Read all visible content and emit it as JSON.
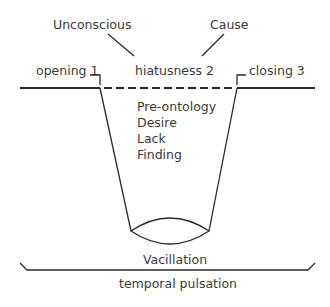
{
  "diagram": {
    "top_labels": {
      "unconscious": "Unconscious",
      "cause": "Cause"
    },
    "line_labels": {
      "opening": "opening 1",
      "hiatusness": "hiatusness 2",
      "closing": "closing 3"
    },
    "gap_contents": [
      "Pre-ontology",
      "Desire",
      "Lack",
      "Finding"
    ],
    "bottom_labels": {
      "vacillation": "Vacillation",
      "temporal_pulsation": "temporal pulsation"
    }
  }
}
